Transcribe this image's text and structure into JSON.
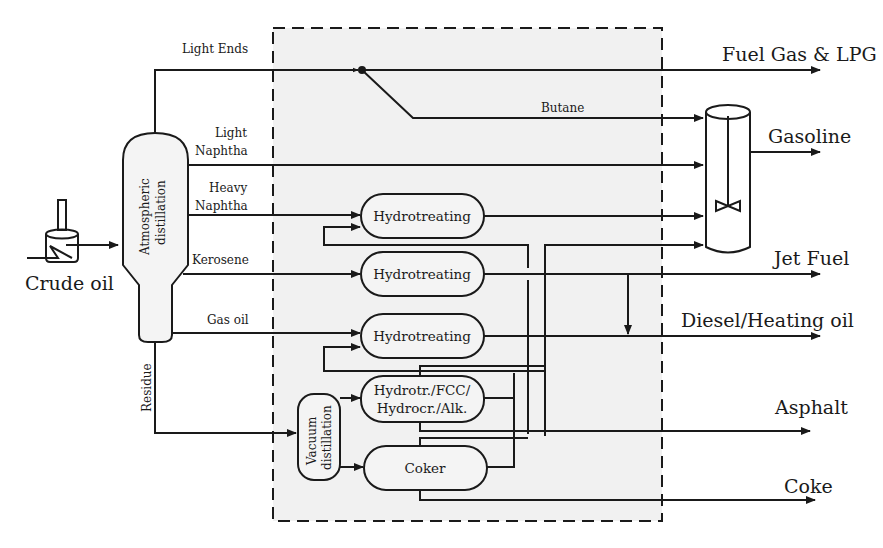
{
  "colors": {
    "line": "#1a1a1a",
    "background": "#ffffff",
    "refinery_area": "#f1f1f1",
    "unit_fill": "#f4f4f4"
  },
  "feed": {
    "label": "Crude oil",
    "icon": "furnace-heater-icon"
  },
  "columns": {
    "atmospheric": {
      "line1": "Atmospheric",
      "line2": "distillation"
    },
    "vacuum": {
      "line1": "Vacuum",
      "line2": "distillation"
    }
  },
  "streams": {
    "light_ends": "Light Ends",
    "light_naphtha": {
      "line1": "Light",
      "line2": "Naphtha"
    },
    "heavy_naphtha": {
      "line1": "Heavy",
      "line2": "Naphtha"
    },
    "kerosene": "Kerosene",
    "gas_oil": "Gas oil",
    "residue": "Residue",
    "butane": "Butane"
  },
  "units": [
    {
      "label": "Hydrotreating"
    },
    {
      "label": "Hydrotreating"
    },
    {
      "label": "Hydrotreating"
    },
    {
      "line1": "Hydrotr./FCC/",
      "line2": "Hydrocr./Alk."
    },
    {
      "label": "Coker"
    }
  ],
  "blender": {
    "icon": "mixing-tank-icon"
  },
  "products": [
    {
      "label": "Fuel Gas & LPG"
    },
    {
      "label": "Gasoline"
    },
    {
      "label": "Jet Fuel"
    },
    {
      "label": "Diesel/Heating oil"
    },
    {
      "label": "Asphalt"
    },
    {
      "label": "Coke"
    }
  ]
}
